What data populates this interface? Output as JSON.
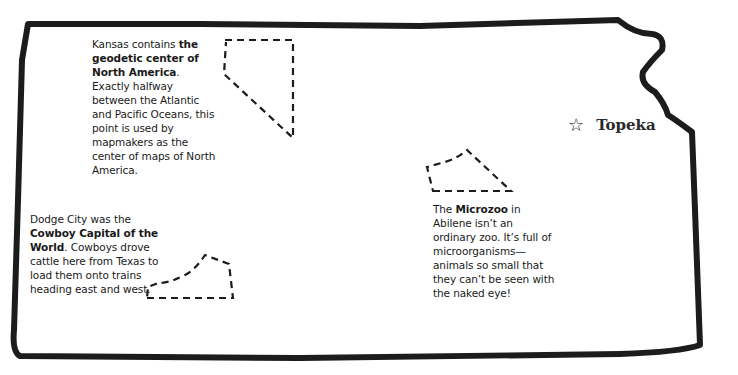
{
  "map": {
    "state": "Kansas",
    "outline_color": "#1c1c1c",
    "capital": {
      "icon": "star-outline-icon",
      "label": "Topeka"
    },
    "facts": [
      {
        "id": "geodetic",
        "pre": "Kansas contains ",
        "bold": "the geodetic center of North America",
        "post": ". Exactly halfway between the Atlantic and Pacific Oceans, this point is used by mapmakers as the center of maps of North America."
      },
      {
        "id": "dodge-city",
        "pre": "Dodge City was the ",
        "bold": "Cowboy Capital of the World",
        "post": ". Cowboys drove cattle here from Texas to load them onto trains heading east and west."
      },
      {
        "id": "microzoo",
        "pre": "The ",
        "bold": "Microzoo",
        "post": " in Abilene isn’t an ordinary zoo. It’s full of microorganisms—animals so small that they can’t be seen with the naked eye!"
      }
    ]
  }
}
